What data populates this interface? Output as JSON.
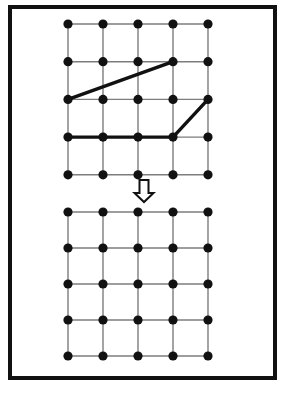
{
  "figure": {
    "canvas": {
      "width": 287,
      "height": 393
    },
    "background_color": "#ffffff",
    "border": {
      "name": "outer-frame",
      "x": 8,
      "y": 5,
      "width": 269,
      "height": 375,
      "stroke_color": "#111111",
      "stroke_width": 4,
      "fill": "none"
    },
    "style": {
      "node_color": "#111111",
      "node_radius": 4.6,
      "grid_line_color": "#7d7d7d",
      "grid_line_width": 1.4,
      "bold_line_color": "#111111",
      "bold_line_width": 3.4,
      "arrow_fill": "#ffffff",
      "arrow_stroke": "#111111"
    },
    "panels": [
      {
        "name": "top-grid-panel",
        "label": "input-grid",
        "rows": 5,
        "cols": 5,
        "origin_x": 68,
        "origin_y": 24,
        "step_x": 35,
        "step_y": 37.7,
        "highlighted_edges": [
          {
            "name": "diagonal-edge-upper",
            "from": [
              2,
              0
            ],
            "to": [
              1,
              3
            ]
          },
          {
            "name": "horizontal-edge-lower-a",
            "from": [
              3,
              0
            ],
            "to": [
              3,
              1
            ]
          },
          {
            "name": "horizontal-edge-lower-b",
            "from": [
              3,
              1
            ],
            "to": [
              3,
              2
            ]
          },
          {
            "name": "horizontal-edge-lower-c",
            "from": [
              3,
              2
            ],
            "to": [
              3,
              3
            ]
          },
          {
            "name": "diagonal-edge-lower",
            "from": [
              3,
              3
            ],
            "to": [
              2,
              4
            ]
          }
        ]
      },
      {
        "name": "bottom-grid-panel",
        "label": "output-grid",
        "rows": 5,
        "cols": 5,
        "origin_x": 68,
        "origin_y": 212,
        "step_x": 35,
        "step_y": 36,
        "highlighted_edges": []
      }
    ],
    "arrow": {
      "name": "down-arrow",
      "direction": "down",
      "center_x": 144,
      "top_y": 180,
      "height": 22,
      "shaft_half_width": 4.5,
      "head_half_width": 9.5,
      "head_height": 9
    }
  }
}
